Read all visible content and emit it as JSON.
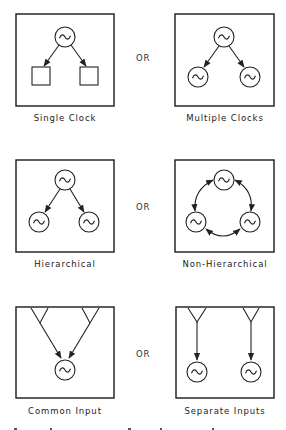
{
  "figure": {
    "rows": [
      {
        "id": "clock-count",
        "left": {
          "label": "Single Clock",
          "description": "One oscillator driving two units"
        },
        "connector": "OR",
        "right": {
          "label": "Multiple Clocks",
          "description": "One oscillator driving two oscillators"
        }
      },
      {
        "id": "hierarchy",
        "left": {
          "label": "Hierarchical",
          "description": "Top oscillator drives two subordinate oscillators"
        },
        "connector": "OR",
        "right": {
          "label": "Non-Hierarchical",
          "description": "Three oscillators mutually coupled with bidirectional arrows"
        }
      },
      {
        "id": "inputs",
        "left": {
          "label": "Common Input",
          "description": "Two inputs converging on one oscillator"
        },
        "connector": "OR",
        "right": {
          "label": "Separate Inputs",
          "description": "Each input drives its own oscillator"
        }
      }
    ],
    "symbols": {
      "oscillator": "~",
      "unit": "square",
      "input": "Y-shaped receptor"
    },
    "colors": {
      "ink": "#222222",
      "background": "#ffffff"
    }
  }
}
